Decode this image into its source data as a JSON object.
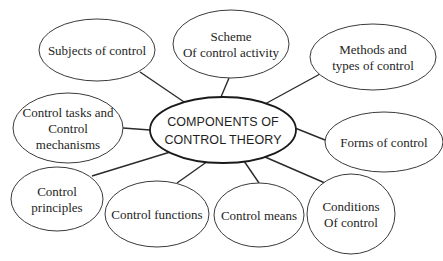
{
  "diagram": {
    "type": "mind-map",
    "center": {
      "lines": [
        "COMPONENTS OF",
        "CONTROL THEORY"
      ],
      "cx": 223,
      "cy": 130,
      "rx": 73,
      "ry": 33
    },
    "nodes": [
      {
        "id": "subjects",
        "lines": [
          "Subjects of control"
        ],
        "cx": 97,
        "cy": 50,
        "rx": 58,
        "ry": 31,
        "edge": [
          140,
          72,
          190,
          106
        ]
      },
      {
        "id": "scheme",
        "lines": [
          "Scheme",
          "Of control activity"
        ],
        "cx": 231,
        "cy": 44,
        "rx": 58,
        "ry": 34,
        "edge": [
          229,
          78,
          221,
          97
        ]
      },
      {
        "id": "methods",
        "lines": [
          "Methods and",
          "types of control"
        ],
        "cx": 373,
        "cy": 57,
        "rx": 63,
        "ry": 33,
        "edge": [
          320,
          74,
          265,
          104
        ]
      },
      {
        "id": "tasks",
        "lines": [
          "Control tasks and",
          "Control",
          "mechanisms"
        ],
        "cx": 68,
        "cy": 128,
        "rx": 55,
        "ry": 35,
        "edge": [
          123,
          128,
          150,
          130
        ]
      },
      {
        "id": "forms",
        "lines": [
          "Forms of control"
        ],
        "cx": 384,
        "cy": 142,
        "rx": 59,
        "ry": 30,
        "edge": [
          325,
          140,
          295,
          128
        ]
      },
      {
        "id": "principles",
        "lines": [
          "Control",
          "principles"
        ],
        "cx": 57,
        "cy": 199,
        "rx": 46,
        "ry": 32,
        "edge": [
          92,
          176,
          180,
          149
        ]
      },
      {
        "id": "functions",
        "lines": [
          "Control functions"
        ],
        "cx": 157,
        "cy": 214,
        "rx": 52,
        "ry": 33,
        "edge": [
          177,
          183,
          208,
          161
        ]
      },
      {
        "id": "means",
        "lines": [
          "Control means"
        ],
        "cx": 259,
        "cy": 215,
        "rx": 45,
        "ry": 32,
        "edge": [
          259,
          183,
          244,
          161
        ]
      },
      {
        "id": "conditions",
        "lines": [
          "Conditions",
          "Of control"
        ],
        "cx": 351,
        "cy": 214,
        "rx": 44,
        "ry": 40,
        "edge": [
          325,
          183,
          265,
          157
        ]
      }
    ],
    "colors": {
      "background": "#ffffff",
      "stroke": "#2a2a2a",
      "text": "#1e1e1e"
    }
  }
}
